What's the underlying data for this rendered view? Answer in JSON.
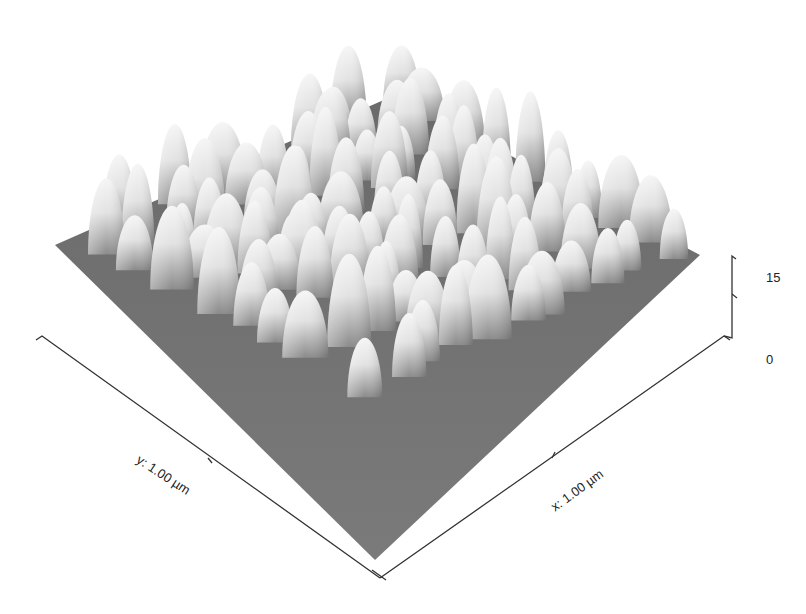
{
  "chart_data": {
    "type": "surface3d",
    "title": "",
    "x_axis": {
      "label": "x: 1.00 µm",
      "range_um": [
        0,
        1.0
      ]
    },
    "y_axis": {
      "label": "y: 1.00 µm",
      "range_um": [
        0,
        1.0
      ]
    },
    "z_axis": {
      "ticks": [
        "15",
        "0"
      ],
      "range": [
        0,
        30
      ],
      "tick_values": [
        0,
        15
      ]
    },
    "colormap": "grayscale (dark low, white high)",
    "grid": false,
    "legend": null
  },
  "labels": {
    "x_axis": "x: 1.00 µm",
    "y_axis": "y: 1.00 µm",
    "z_top": "15",
    "z_bottom": "0"
  },
  "colors": {
    "base": "#6e6e6e",
    "peak": "#f4f4f4",
    "axis": "#333333"
  }
}
